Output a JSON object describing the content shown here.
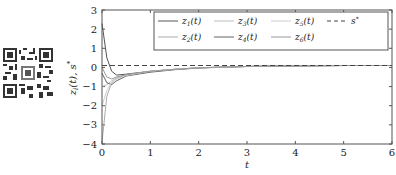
{
  "chart_data": {
    "type": "line",
    "title": "",
    "xlabel": "t",
    "ylabel": "z_i(t), s*",
    "xlim": [
      0,
      6
    ],
    "ylim": [
      -4,
      3
    ],
    "xticks": [
      "0",
      "1",
      "2",
      "3",
      "4",
      "5",
      "6"
    ],
    "yticks": [
      "3",
      "2",
      "1",
      "0",
      "-1",
      "-2",
      "-3",
      "-4"
    ],
    "grid": false,
    "legend_position": "upper right (inside, 2 rows x 4 cols)",
    "series": [
      {
        "name": "z1(t)",
        "style": "solid",
        "color": "#555555",
        "x": [
          0,
          0.1,
          0.2,
          0.3,
          0.5,
          1.0,
          1.5,
          2.0,
          3.0,
          4.0,
          5.0,
          6.0
        ],
        "y": [
          2.3,
          0.5,
          -0.2,
          -0.4,
          -0.35,
          -0.2,
          -0.1,
          -0.02,
          0.05,
          0.08,
          0.1,
          0.1
        ]
      },
      {
        "name": "z2(t)",
        "style": "solid",
        "color": "#aaaaaa",
        "x": [
          0,
          0.1,
          0.2,
          0.3,
          0.5,
          1.0,
          1.5,
          2.0,
          3.0,
          4.0,
          5.0,
          6.0
        ],
        "y": [
          -3.9,
          -1.5,
          -0.8,
          -0.6,
          -0.4,
          -0.2,
          -0.1,
          -0.02,
          0.05,
          0.08,
          0.1,
          0.1
        ]
      },
      {
        "name": "z3(t)",
        "style": "solid",
        "color": "#bbbbbb",
        "x": [
          0,
          0.1,
          0.2,
          0.3,
          0.5,
          1.0,
          1.5,
          2.0,
          3.0,
          4.0,
          5.0,
          6.0
        ],
        "y": [
          -1.0,
          -0.9,
          -0.7,
          -0.55,
          -0.4,
          -0.22,
          -0.1,
          -0.02,
          0.05,
          0.08,
          0.1,
          0.1
        ]
      },
      {
        "name": "z4(t)",
        "style": "solid",
        "color": "#666666",
        "x": [
          0,
          0.1,
          0.2,
          0.3,
          0.5,
          1.0,
          1.5,
          2.0,
          3.0,
          4.0,
          5.0,
          6.0
        ],
        "y": [
          -0.3,
          -0.8,
          -0.9,
          -0.7,
          -0.45,
          -0.25,
          -0.12,
          -0.03,
          0.05,
          0.08,
          0.1,
          0.1
        ]
      },
      {
        "name": "z5(t)",
        "style": "solid",
        "color": "#cccccc",
        "x": [
          0,
          0.1,
          0.2,
          0.3,
          0.5,
          1.0,
          1.5,
          2.0,
          3.0,
          4.0,
          5.0,
          6.0
        ],
        "y": [
          -2.0,
          -1.2,
          -0.8,
          -0.6,
          -0.42,
          -0.2,
          -0.1,
          -0.02,
          0.05,
          0.08,
          0.1,
          0.1
        ]
      },
      {
        "name": "z6(t)",
        "style": "solid",
        "color": "#999999",
        "x": [
          0,
          0.1,
          0.2,
          0.3,
          0.5,
          1.0,
          1.5,
          2.0,
          3.0,
          4.0,
          5.0,
          6.0
        ],
        "y": [
          0.0,
          -0.5,
          -0.6,
          -0.5,
          -0.38,
          -0.2,
          -0.1,
          -0.02,
          0.05,
          0.08,
          0.1,
          0.1
        ]
      },
      {
        "name": "s*",
        "style": "dashed",
        "color": "#444444",
        "x": [
          0,
          6
        ],
        "y": [
          0.1,
          0.1
        ]
      }
    ]
  },
  "legend": {
    "items": [
      "z1(t)",
      "z3(t)",
      "z5(t)",
      "s*",
      "z2(t)",
      "z4(t)",
      "z6(t)"
    ]
  },
  "qr_code": {
    "present": true
  }
}
